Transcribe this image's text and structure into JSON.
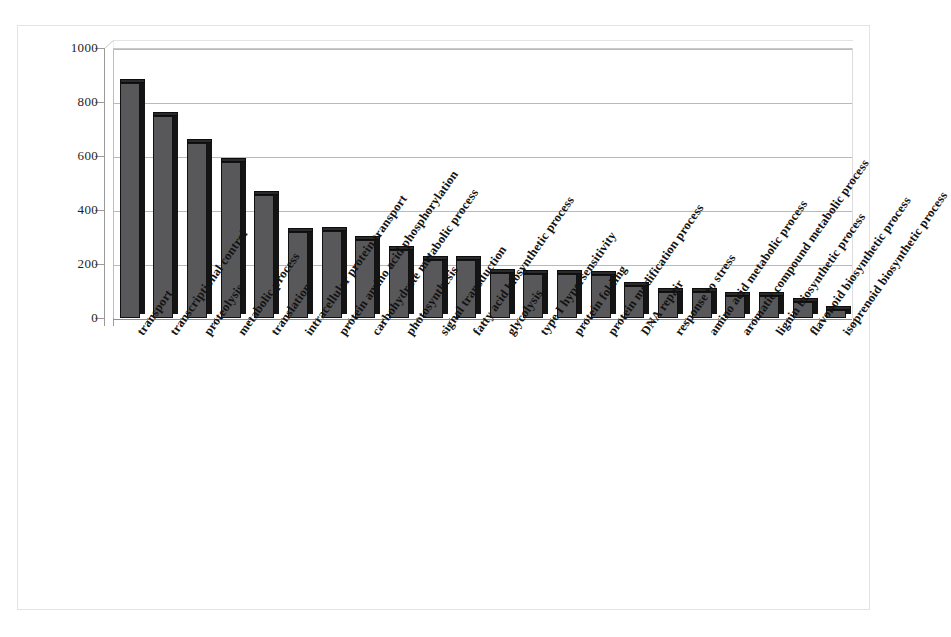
{
  "figure": {
    "title": "",
    "background_color": "#ffffff",
    "bar_color": "#58585a",
    "bar_outline_color": "#111111",
    "gridline_color": "#b9b9b9",
    "axis_color": "#9a9a9a"
  },
  "chart_data": {
    "type": "bar",
    "title": "",
    "subtitle": "",
    "xlabel": "",
    "ylabel": "",
    "ylim": [
      0,
      1000
    ],
    "yticks": [
      0,
      200,
      400,
      600,
      800,
      1000
    ],
    "ytick_labels": [
      "0",
      "200",
      "400",
      "600",
      "800",
      "1000"
    ],
    "grid": true,
    "legend": null,
    "orientation": "vertical",
    "style_3d": true,
    "categories": [
      "transport",
      "transcriptional control",
      "proteolysis",
      "metabolic process",
      "translation",
      "intracellular protein transport",
      "protein amino acid phosphorylation",
      "carbohydrate metabolic process",
      "photosynthesis",
      "signal transduction",
      "fatty acid biosynthetic process",
      "glycolysis",
      "type I hypersensitivity",
      "protein folding",
      "protein modification process",
      "DNA repair",
      "response to stress",
      "amino acid metabolic process",
      "aromatic compound metabolic process",
      "lignin biosynthetic process",
      "flavonoid biosynthetic process",
      "isoprenoid biosynthetic process"
    ],
    "values": [
      870,
      750,
      650,
      578,
      455,
      320,
      322,
      288,
      252,
      215,
      215,
      165,
      163,
      162,
      158,
      120,
      98,
      98,
      80,
      80,
      58,
      30
    ]
  }
}
